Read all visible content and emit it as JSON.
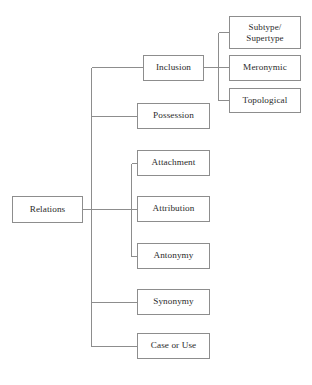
{
  "diagram": {
    "type": "tree-hierarchy",
    "orientation": "left-to-right",
    "root_label": "Relations",
    "line_color": "#8d8d8d",
    "box_border_color": "#8d8d8d",
    "box_fill_color": "#ffffff",
    "text_color": "#2b2b2b",
    "background_color": "#ffffff",
    "nodes": {
      "root": {
        "label": "Relations"
      },
      "level1": [
        {
          "key": "inclusion",
          "label": "Inclusion"
        },
        {
          "key": "possession",
          "label": "Possession"
        },
        {
          "key": "attachment",
          "label": "Attachment"
        },
        {
          "key": "attribution",
          "label": "Attribution"
        },
        {
          "key": "antonymy",
          "label": "Antonymy"
        },
        {
          "key": "synonymy",
          "label": "Synonymy"
        },
        {
          "key": "case_or_use",
          "label": "Case or Use"
        }
      ],
      "level2_inclusion": [
        {
          "key": "subtype_supertype",
          "label": "Subtype/\nSupertype"
        },
        {
          "key": "meronymic",
          "label": "Meronymic"
        },
        {
          "key": "topological",
          "label": "Topological"
        }
      ]
    },
    "caption": ""
  }
}
